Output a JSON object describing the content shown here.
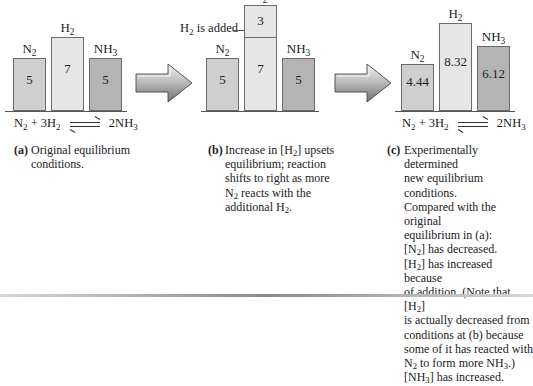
{
  "chart_data": {
    "type": "bar",
    "categories": [
      "N2",
      "H2",
      "NH3"
    ],
    "panels": [
      {
        "id": "a",
        "series": [
          {
            "name": "N2",
            "value": 5
          },
          {
            "name": "H2",
            "value": 7
          },
          {
            "name": "NH3",
            "value": 5
          }
        ]
      },
      {
        "id": "b",
        "series": [
          {
            "name": "N2",
            "value": 5
          },
          {
            "name": "H2",
            "value": 7,
            "added": 3
          },
          {
            "name": "NH3",
            "value": 5
          }
        ],
        "annotation": "H2 is added"
      },
      {
        "id": "c",
        "series": [
          {
            "name": "N2",
            "value": 4.44
          },
          {
            "name": "H2",
            "value": 8.32
          },
          {
            "name": "NH3",
            "value": 6.12
          }
        ]
      }
    ],
    "ylim": [
      0,
      10
    ],
    "grid": false
  },
  "labels": {
    "n2": "N",
    "n2_sub": "2",
    "h2": "H",
    "h2_sub": "2",
    "nh3": "NH",
    "nh3_sub": "3",
    "added_label": "H",
    "added_label_sub": "2",
    "added_label_rest": " is added"
  },
  "values": {
    "a": {
      "n2": "5",
      "h2": "7",
      "nh3": "5"
    },
    "b": {
      "n2": "5",
      "h2_old": "7",
      "h2_added": "3",
      "nh3": "5"
    },
    "c": {
      "n2": "4.44",
      "h2": "8.32",
      "nh3": "6.12"
    }
  },
  "equation": {
    "left_a": "N",
    "left_a_sub": "2",
    "plus": " + 3H",
    "plus_sub": "2",
    "right": "2NH",
    "right_sub": "3"
  },
  "captions": {
    "a": {
      "label": "(a)",
      "text": "Original equilibrium conditions."
    },
    "b": {
      "label": "(b)",
      "line1_pre": "Increase in [H",
      "line1_sub": "2",
      "line1_post": "] upsets",
      "line2": "equilibrium; reaction",
      "line3": "shifts to right as more",
      "line4_pre": "N",
      "line4_sub": "2",
      "line4_post": " reacts with the",
      "line5_pre": "additional H",
      "line5_sub": "2",
      "line5_post": "."
    },
    "c": {
      "label": "(c)",
      "line1": "Experimentally determined",
      "line2": "new equilibrium conditions.",
      "line3": "Compared with the original",
      "line4": "equilibrium in (a):",
      "line5_pre": "[N",
      "line5_sub": "2",
      "line5_post": "] has decreased.",
      "line6_pre": "[H",
      "line6_sub": "2",
      "line6_post": "] has increased because",
      "line7_pre": "of addition. (Note that [H",
      "line7_sub": "2",
      "line7_post": "]",
      "line8": "is actually decreased from",
      "line9": "conditions at (b) because",
      "line10": "some of it has reacted with",
      "line11_pre": "N",
      "line11_sub": "2",
      "line11_post": " to form more NH",
      "line11_sub2": "3",
      "line11_post2": ".)",
      "line12_pre": "[NH",
      "line12_sub": "3",
      "line12_post": "] has increased."
    }
  }
}
